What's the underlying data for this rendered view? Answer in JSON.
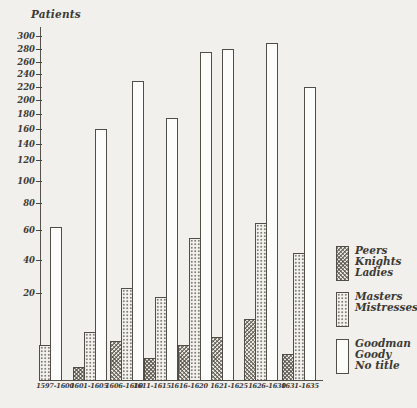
{
  "figure": {
    "title": "Patients"
  },
  "chart_data": {
    "type": "bar",
    "title": "Patients",
    "ylabel": "Patients",
    "categories": [
      "1597-1600",
      "1601-1605",
      "1606-1610",
      "1611-1615",
      "1616-1620",
      "1621-1625",
      "1626-1630",
      "1631-1635"
    ],
    "series": [
      {
        "name": "Peers Knights Ladies",
        "legend_lines": [
          "Peers",
          "Knights",
          "Ladies"
        ],
        "pattern": "crosshatch",
        "values": [
          null,
          3,
          9,
          5,
          8,
          10,
          14,
          6
        ]
      },
      {
        "name": "Masters Mistresses",
        "legend_lines": [
          "Masters",
          "Mistresses"
        ],
        "pattern": "stipple",
        "values": [
          8,
          11,
          23,
          19,
          55,
          null,
          65,
          45
        ]
      },
      {
        "name": "Goodman Goody No title",
        "legend_lines": [
          "Goodman",
          "Goody",
          "No title"
        ],
        "pattern": "plain",
        "values": [
          62,
          160,
          230,
          175,
          275,
          280,
          290,
          220
        ]
      }
    ],
    "ylim": [
      0,
      300
    ],
    "y_tick_labels": [
      "300",
      "280",
      "260",
      "240",
      "220",
      "200",
      "180",
      "160",
      "140",
      "120",
      "100",
      "80",
      "60",
      "40",
      "20"
    ],
    "grid": false,
    "legend_position": "right",
    "axis_style": "hand-drawn, non-linear lower scale"
  },
  "colors": {
    "paper": "#f1f0ed",
    "ink": "#3c3a35",
    "bar_outline": "#514e48"
  }
}
